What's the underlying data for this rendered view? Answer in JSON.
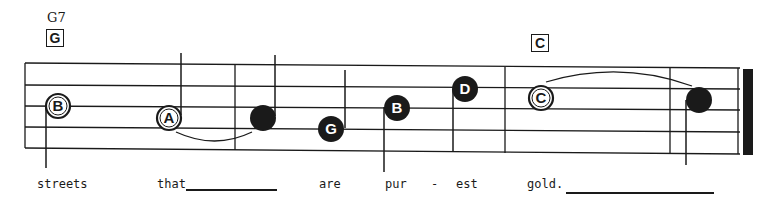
{
  "chords": [
    {
      "name": "G7",
      "box": "G"
    },
    {
      "name": "",
      "box": "C"
    }
  ],
  "notes": [
    {
      "letter": "B",
      "style": "open",
      "duration": "half"
    },
    {
      "letter": "A",
      "style": "open",
      "duration": "half"
    },
    {
      "letter": "",
      "style": "filled",
      "duration": "half"
    },
    {
      "letter": "G",
      "style": "filled",
      "duration": "quarter"
    },
    {
      "letter": "B",
      "style": "filled",
      "duration": "quarter"
    },
    {
      "letter": "D",
      "style": "filled",
      "duration": "quarter"
    },
    {
      "letter": "C",
      "style": "open",
      "duration": "whole"
    },
    {
      "letter": "",
      "style": "filled",
      "duration": "half"
    }
  ],
  "lyrics": [
    {
      "text": "streets"
    },
    {
      "text": "that"
    },
    {
      "text": "are"
    },
    {
      "text": "pur"
    },
    {
      "text": "-"
    },
    {
      "text": "est"
    },
    {
      "text": "gold."
    }
  ],
  "colors": {
    "ink": "#1a1a1a",
    "paper": "#ffffff"
  }
}
